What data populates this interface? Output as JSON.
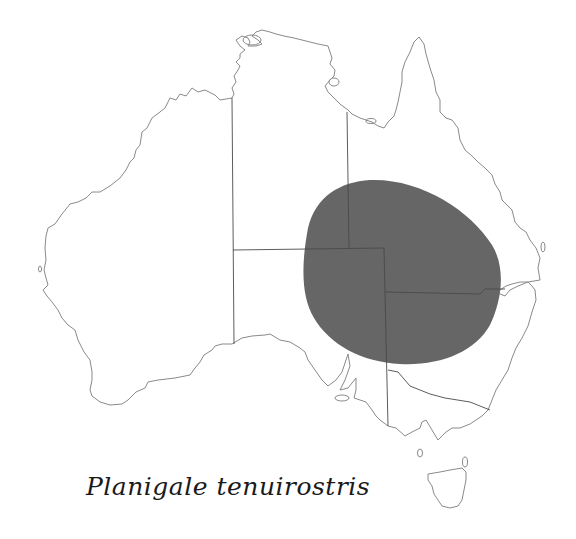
{
  "map": {
    "title": "Australia distribution map",
    "species_label": "Planigale tenuirostris",
    "range_color": "#666666",
    "coast_color": "#8a8a8a",
    "border_color": "#4a4a4a",
    "regions": [
      "Western Australia",
      "Northern Territory",
      "South Australia",
      "Queensland",
      "New South Wales",
      "Victoria",
      "Tasmania"
    ],
    "distribution": {
      "description": "Shaded range covering south-west Queensland, north-west New South Wales, north-east South Australia and south-east Northern Territory"
    }
  }
}
